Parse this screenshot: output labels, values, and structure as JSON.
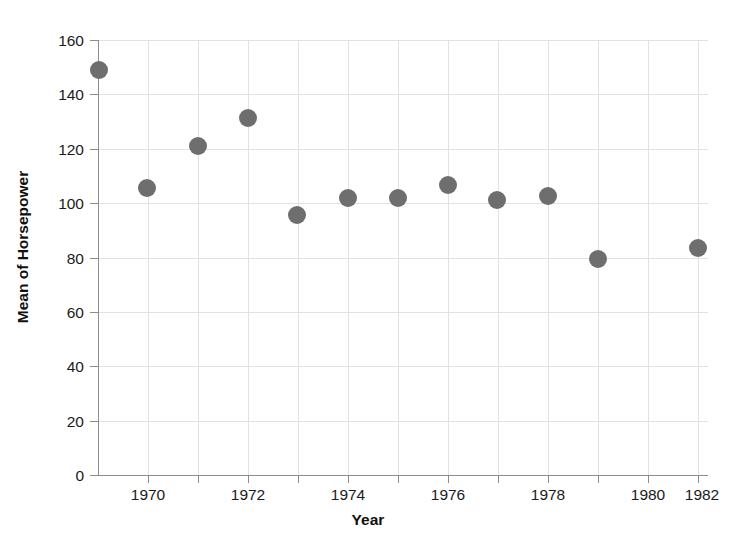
{
  "chart_data": {
    "type": "scatter",
    "title": "",
    "xlabel": "Year",
    "ylabel": "Mean of Horsepower",
    "xlim": [
      1969.0,
      1982.6
    ],
    "ylim": [
      0,
      162
    ],
    "grid": true,
    "legend": null,
    "marker": {
      "shape": "circle",
      "color": "#6e6e6e",
      "size_px": 18
    },
    "x_ticks": [
      {
        "value": 1970,
        "label": "1970",
        "major": true
      },
      {
        "value": 1971,
        "label": "",
        "major": false
      },
      {
        "value": 1972,
        "label": "1972",
        "major": true
      },
      {
        "value": 1973,
        "label": "",
        "major": false
      },
      {
        "value": 1974,
        "label": "1974",
        "major": true
      },
      {
        "value": 1975,
        "label": "",
        "major": false
      },
      {
        "value": 1976,
        "label": "1976",
        "major": true
      },
      {
        "value": 1977,
        "label": "",
        "major": false
      },
      {
        "value": 1978,
        "label": "1978",
        "major": true
      },
      {
        "value": 1979,
        "label": "",
        "major": false
      },
      {
        "value": 1980,
        "label": "1980",
        "major": true
      },
      {
        "value": 1981,
        "label": "",
        "major": false
      },
      {
        "value": 1982,
        "label": "1982",
        "major": true
      }
    ],
    "y_ticks": [
      {
        "value": 0,
        "label": "0"
      },
      {
        "value": 20,
        "label": "20"
      },
      {
        "value": 40,
        "label": "40"
      },
      {
        "value": 60,
        "label": "60"
      },
      {
        "value": 80,
        "label": "80"
      },
      {
        "value": 100,
        "label": "100"
      },
      {
        "value": 120,
        "label": "120"
      },
      {
        "value": 140,
        "label": "140"
      },
      {
        "value": 160,
        "label": "160"
      }
    ],
    "x": [
      1970.0,
      1971.0,
      1972.0,
      1973.0,
      1974.0,
      1975.0,
      1976.0,
      1977.0,
      1978.0,
      1979.0,
      1980.0,
      1982.0
    ],
    "y": [
      149.0,
      105.5,
      121.0,
      131.5,
      95.5,
      102.0,
      102.0,
      106.5,
      101.0,
      102.5,
      79.5,
      83.5
    ],
    "points": [
      {
        "x": 1970.0,
        "y": 149.0,
        "px": 99,
        "py": 70
      },
      {
        "x": 1971.0,
        "y": 105.5,
        "px": 147,
        "py": 188
      },
      {
        "x": 1972.0,
        "y": 121.0,
        "px": 198,
        "py": 146
      },
      {
        "x": 1973.0,
        "y": 131.5,
        "px": 248,
        "py": 118
      },
      {
        "x": 1974.0,
        "y": 95.5,
        "px": 297,
        "py": 215
      },
      {
        "x": 1975.0,
        "y": 102.0,
        "px": 348,
        "py": 198
      },
      {
        "x": 1976.0,
        "y": 102.0,
        "px": 398,
        "py": 198
      },
      {
        "x": 1977.0,
        "y": 106.5,
        "px": 448,
        "py": 185
      },
      {
        "x": 1978.0,
        "y": 101.0,
        "px": 497,
        "py": 200
      },
      {
        "x": 1979.0,
        "y": 102.5,
        "px": 548,
        "py": 196
      },
      {
        "x": 1980.0,
        "y": 79.5,
        "px": 598,
        "py": 259
      },
      {
        "x": 1982.0,
        "y": 83.5,
        "px": 698,
        "py": 248
      }
    ]
  }
}
